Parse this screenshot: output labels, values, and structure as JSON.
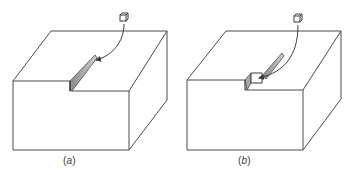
{
  "figure": {
    "panels": [
      {
        "id": "a",
        "caption_open": "(",
        "caption_letter": "a",
        "caption_close": ")",
        "description": "Block with a thin slot; small cube inserted via curved arrow into the slot"
      },
      {
        "id": "b",
        "caption_open": "(",
        "caption_letter": "b",
        "caption_close": ")",
        "description": "Block with a thin slot and a small square window; small cube inserted via curved arrow into the window"
      }
    ],
    "colors": {
      "line": "#4a4a4a",
      "slot_fill": "#9a9a9a",
      "slot_fill_light": "#c8c8c8",
      "background": "#ffffff"
    }
  }
}
